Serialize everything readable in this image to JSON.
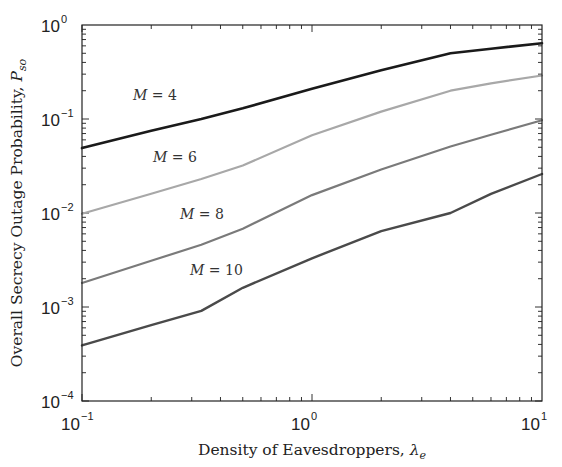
{
  "chart_data": {
    "type": "line",
    "title": "",
    "xlabel": "Density of Eavesdroppers, λe",
    "ylabel": "Overall Secrecy Outage Probability, Pso",
    "xscale": "log",
    "yscale": "log",
    "xlim": [
      0.1,
      10
    ],
    "ylim": [
      0.0001,
      1
    ],
    "grid": false,
    "legend": "inline labels",
    "x_ticks": [
      {
        "base": "10",
        "exp": "−1",
        "value": 0.1
      },
      {
        "base": "10",
        "exp": "0",
        "value": 1
      },
      {
        "base": "10",
        "exp": "1",
        "value": 10
      }
    ],
    "y_ticks": [
      {
        "base": "10",
        "exp": "0",
        "value": 1
      },
      {
        "base": "10",
        "exp": "−1",
        "value": 0.1
      },
      {
        "base": "10",
        "exp": "−2",
        "value": 0.01
      },
      {
        "base": "10",
        "exp": "−3",
        "value": 0.001
      },
      {
        "base": "10",
        "exp": "−4",
        "value": 0.0001
      }
    ],
    "x": [
      0.1,
      0.2,
      0.33,
      0.5,
      1,
      2,
      4,
      6,
      10
    ],
    "series": [
      {
        "name": "M = 4",
        "color": "#1a1a1a",
        "width": 2.6,
        "values": [
          0.049,
          0.075,
          0.1,
          0.13,
          0.21,
          0.33,
          0.5,
          0.56,
          0.64
        ]
      },
      {
        "name": "M = 6",
        "color": "#a8a8a8",
        "width": 2.2,
        "values": [
          0.0098,
          0.016,
          0.023,
          0.032,
          0.067,
          0.12,
          0.2,
          0.24,
          0.29
        ]
      },
      {
        "name": "M = 8",
        "color": "#7a7a7a",
        "width": 2.2,
        "values": [
          0.0018,
          0.0031,
          0.0046,
          0.0068,
          0.0155,
          0.029,
          0.051,
          0.068,
          0.097
        ]
      },
      {
        "name": "M = 10",
        "color": "#4a4a4a",
        "width": 2.4,
        "values": [
          0.00039,
          0.00064,
          0.00091,
          0.0016,
          0.0033,
          0.0064,
          0.01,
          0.016,
          0.026
        ]
      }
    ],
    "annotations": [
      {
        "text_var": "M",
        "text_rest": " = 4",
        "x_px": 133,
        "y_px": 100
      },
      {
        "text_var": "M",
        "text_rest": " = 6",
        "x_px": 153,
        "y_px": 162
      },
      {
        "text_var": "M",
        "text_rest": " = 8",
        "x_px": 180,
        "y_px": 219
      },
      {
        "text_var": "M",
        "text_rest": " = 10",
        "x_px": 190,
        "y_px": 275
      }
    ]
  },
  "axes": {
    "xlabel_main": "Density of Eavesdroppers, ",
    "xlabel_symbol": "λ",
    "xlabel_sub": "e",
    "ylabel_main": "Overall Secrecy Outage Probability, ",
    "ylabel_symbol": "P",
    "ylabel_sub": "so"
  }
}
